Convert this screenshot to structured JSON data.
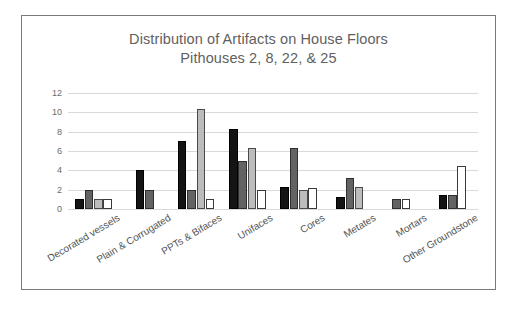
{
  "chart_data": {
    "type": "bar",
    "title": "Distribution of Artifacts on House Floors",
    "subtitle": "Pithouses 2, 8, 22, & 25",
    "xlabel": "",
    "ylabel": "",
    "ylim": [
      0,
      12
    ],
    "yticks": [
      0,
      2,
      4,
      6,
      8,
      10,
      12
    ],
    "grid": true,
    "legend": "none",
    "categories": [
      "Decorated vessels",
      "Plain & Corrugated",
      "PPTs & Bifaces",
      "Unifaces",
      "Cores",
      "Metates",
      "Mortars",
      "Other Groundstone"
    ],
    "series": [
      {
        "name": "Pithouse 2",
        "color": "#141414",
        "values": [
          1,
          4,
          7,
          8.3,
          2.3,
          1.2,
          0,
          1.5
        ]
      },
      {
        "name": "Pithouse 8",
        "color": "#636363",
        "values": [
          2,
          2,
          2,
          5,
          6.3,
          3.2,
          1,
          1.4
        ]
      },
      {
        "name": "Pithouse 22",
        "color": "#bcbcbc",
        "values": [
          1,
          0,
          10.3,
          6.3,
          2,
          2.3,
          0,
          0
        ]
      },
      {
        "name": "Pithouse 25",
        "color": "#ffffff",
        "values": [
          1,
          0,
          1,
          2,
          2.2,
          0,
          1,
          4.5
        ]
      }
    ]
  }
}
